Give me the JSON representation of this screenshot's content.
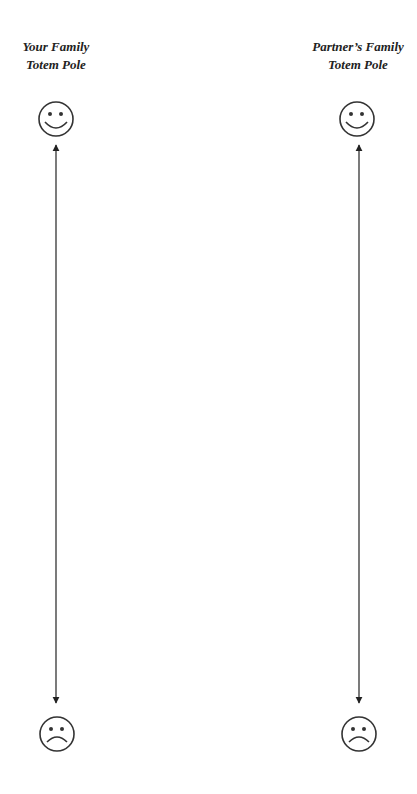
{
  "columns": [
    {
      "title_lines": [
        "Your Family",
        "Totem Pole"
      ],
      "top_icon": "smiley-face-icon",
      "bottom_icon": "sad-face-icon"
    },
    {
      "title_lines": [
        "Partner’s Family",
        "Totem Pole"
      ],
      "top_icon": "smiley-face-icon",
      "bottom_icon": "sad-face-icon"
    }
  ],
  "colors": {
    "stroke": "#333333",
    "text": "#222222",
    "background": "#ffffff"
  }
}
